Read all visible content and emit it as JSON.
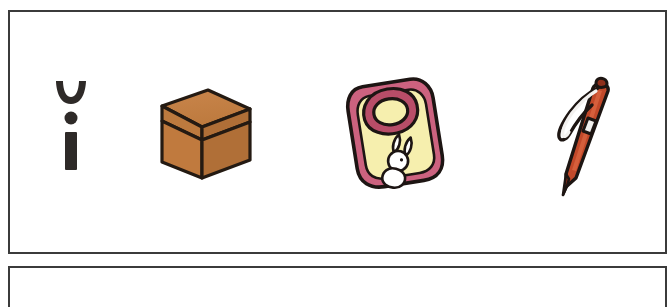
{
  "worksheet": {
    "title": "Picture row worksheet",
    "background_color": "#ffffff",
    "panel_border_color": "#3b3b3b",
    "panels": [
      {
        "name": "items-panel",
        "label": "Picture items row"
      },
      {
        "name": "answer-panel",
        "label": "Blank answer row"
      }
    ]
  },
  "items": [
    {
      "name": "letter-glyph",
      "label": "Letter glyph",
      "description": "Breve arc above a dot above a vertical bar",
      "color": "#2e2a28"
    },
    {
      "name": "cardboard-box",
      "label": "Box",
      "description": "Brown cardboard box with lid, three-quarter view",
      "color": "#c07a3e",
      "lid_color": "#c98248",
      "side_color": "#b06f37",
      "outline_color": "#241a12"
    },
    {
      "name": "baby-bib",
      "label": "Bib",
      "description": "Pink-trimmed baby bib with pale yellow body and white bunny motif",
      "color": "#cc627f",
      "body_color": "#f6efae",
      "motif_color": "#ffffff",
      "outline_color": "#1d1513"
    },
    {
      "name": "ballpoint-pen",
      "label": "Pen",
      "description": "Red-orange ballpoint pen with clip and silver band, tilted",
      "color": "#c2492a",
      "highlight_color": "#d8633f",
      "band_color": "#f2f0ee",
      "outline_color": "#1d1512"
    }
  ],
  "colors": {
    "page_background": "#ffffff",
    "frame": "#3b3b3b",
    "ink": "#2e2a28"
  }
}
